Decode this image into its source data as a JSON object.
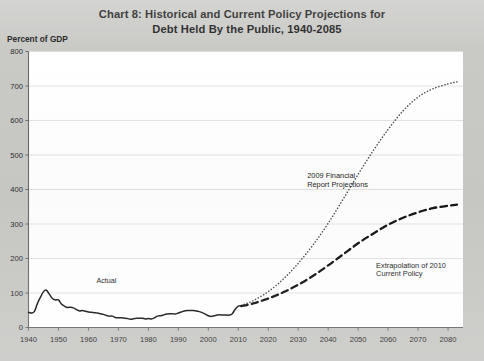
{
  "chart_data": {
    "type": "line",
    "title": "Chart 8:  Historical and Current Policy Projections for",
    "title_line2": "Debt Held By the Public, 1940-2085",
    "ylabel": "Percent of GDP",
    "xlabel": "",
    "xlim": [
      1940,
      2085
    ],
    "ylim": [
      0,
      800
    ],
    "yticks": [
      0,
      100,
      200,
      300,
      400,
      500,
      600,
      700,
      800
    ],
    "xticks": [
      1940,
      1950,
      1960,
      1970,
      1980,
      1990,
      2000,
      2010,
      2020,
      2030,
      2040,
      2050,
      2060,
      2070,
      2080
    ],
    "grid": true,
    "legend_position": "none",
    "annotations": [
      {
        "text": "Actual",
        "x": 1966,
        "y": 128
      },
      {
        "text": "2009 Financial",
        "x": 2033,
        "y": 432
      },
      {
        "text": "Report Projections",
        "x": 2033,
        "y": 408
      },
      {
        "text": "Extrapolation of 2010",
        "x": 2056,
        "y": 172
      },
      {
        "text": "Current Policy",
        "x": 2056,
        "y": 148
      }
    ],
    "series": [
      {
        "name": "Actual",
        "style": "solid",
        "color": "#1a1a1a",
        "points": [
          [
            1940,
            44
          ],
          [
            1941,
            42
          ],
          [
            1942,
            47
          ],
          [
            1943,
            70
          ],
          [
            1944,
            88
          ],
          [
            1945,
            104
          ],
          [
            1946,
            108
          ],
          [
            1947,
            96
          ],
          [
            1948,
            84
          ],
          [
            1949,
            80
          ],
          [
            1950,
            80
          ],
          [
            1951,
            68
          ],
          [
            1952,
            62
          ],
          [
            1953,
            58
          ],
          [
            1954,
            59
          ],
          [
            1955,
            57
          ],
          [
            1956,
            52
          ],
          [
            1957,
            48
          ],
          [
            1958,
            49
          ],
          [
            1959,
            47
          ],
          [
            1960,
            45
          ],
          [
            1961,
            44
          ],
          [
            1962,
            43
          ],
          [
            1963,
            42
          ],
          [
            1964,
            40
          ],
          [
            1965,
            38
          ],
          [
            1966,
            35
          ],
          [
            1967,
            33
          ],
          [
            1968,
            33
          ],
          [
            1969,
            29
          ],
          [
            1970,
            28
          ],
          [
            1971,
            28
          ],
          [
            1972,
            27
          ],
          [
            1973,
            26
          ],
          [
            1974,
            24
          ],
          [
            1975,
            25
          ],
          [
            1976,
            27
          ],
          [
            1977,
            27
          ],
          [
            1978,
            27
          ],
          [
            1979,
            25
          ],
          [
            1980,
            26
          ],
          [
            1981,
            25
          ],
          [
            1982,
            28
          ],
          [
            1983,
            33
          ],
          [
            1984,
            34
          ],
          [
            1985,
            36
          ],
          [
            1986,
            39
          ],
          [
            1987,
            40
          ],
          [
            1988,
            40
          ],
          [
            1989,
            39
          ],
          [
            1990,
            42
          ],
          [
            1991,
            45
          ],
          [
            1992,
            48
          ],
          [
            1993,
            49
          ],
          [
            1994,
            49
          ],
          [
            1995,
            49
          ],
          [
            1996,
            48
          ],
          [
            1997,
            46
          ],
          [
            1998,
            43
          ],
          [
            1999,
            39
          ],
          [
            2000,
            34
          ],
          [
            2001,
            32
          ],
          [
            2002,
            34
          ],
          [
            2003,
            36
          ],
          [
            2004,
            37
          ],
          [
            2005,
            36
          ],
          [
            2006,
            36
          ],
          [
            2007,
            36
          ],
          [
            2008,
            40
          ],
          [
            2009,
            53
          ],
          [
            2010,
            62
          ],
          [
            2011,
            63
          ]
        ]
      },
      {
        "name": "2009 Financial Report Projections",
        "style": "dotted",
        "color": "#4a4a4a",
        "points": [
          [
            2011,
            64
          ],
          [
            2015,
            78
          ],
          [
            2020,
            104
          ],
          [
            2025,
            140
          ],
          [
            2030,
            186
          ],
          [
            2035,
            240
          ],
          [
            2040,
            302
          ],
          [
            2045,
            372
          ],
          [
            2050,
            444
          ],
          [
            2055,
            512
          ],
          [
            2060,
            574
          ],
          [
            2065,
            628
          ],
          [
            2070,
            668
          ],
          [
            2075,
            692
          ],
          [
            2080,
            706
          ],
          [
            2083,
            712
          ]
        ]
      },
      {
        "name": "Extrapolation of 2010 Current Policy",
        "style": "dashed",
        "color": "#141414",
        "points": [
          [
            2011,
            62
          ],
          [
            2015,
            70
          ],
          [
            2020,
            84
          ],
          [
            2025,
            102
          ],
          [
            2030,
            124
          ],
          [
            2035,
            150
          ],
          [
            2040,
            180
          ],
          [
            2045,
            212
          ],
          [
            2050,
            244
          ],
          [
            2055,
            272
          ],
          [
            2060,
            298
          ],
          [
            2065,
            318
          ],
          [
            2070,
            334
          ],
          [
            2075,
            346
          ],
          [
            2080,
            353
          ],
          [
            2083,
            356
          ]
        ]
      }
    ]
  }
}
